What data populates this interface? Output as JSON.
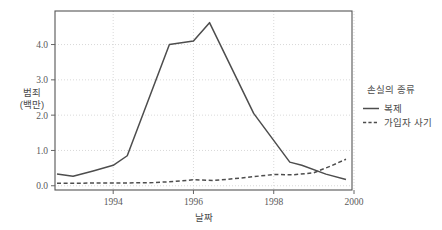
{
  "chart_data": {
    "type": "line",
    "title": "",
    "xlabel": "날짜",
    "ylabel": "범죄\n(백만)",
    "ylabel_line1": "범죄",
    "ylabel_line2": "(백만)",
    "xlim": [
      1992.55,
      1999.95
    ],
    "ylim": [
      -0.12,
      4.95
    ],
    "xticks": [
      1994,
      1996,
      1998,
      2000
    ],
    "xtick_labels": [
      "1994",
      "1996",
      "1998",
      "2000"
    ],
    "yticks": [
      0.0,
      1.0,
      2.0,
      3.0,
      4.0
    ],
    "ytick_labels": [
      "0.0",
      "1.0",
      "2.0",
      "3.0",
      "4.0"
    ],
    "grid": true,
    "grid_style": "dotted",
    "legend_position": "right",
    "legend_title": "손실의 종류",
    "series": [
      {
        "name": "복제",
        "style": "solid",
        "color": "#4d4d4d",
        "x": [
          1992.6,
          1993.0,
          1993.5,
          1994.0,
          1994.35,
          1995.4,
          1996.0,
          1996.4,
          1997.5,
          1998.4,
          1998.7,
          1999.3,
          1999.8
        ],
        "y": [
          0.33,
          0.27,
          0.42,
          0.58,
          0.85,
          4.0,
          4.1,
          4.62,
          2.05,
          0.67,
          0.58,
          0.33,
          0.18
        ]
      },
      {
        "name": "가입자 사기",
        "style": "dashed",
        "color": "#4d4d4d",
        "x": [
          1992.6,
          1993.0,
          1993.6,
          1994.3,
          1995.0,
          1995.5,
          1996.0,
          1996.5,
          1997.2,
          1998.0,
          1998.5,
          1999.0,
          1999.4,
          1999.8
        ],
        "y": [
          0.07,
          0.07,
          0.08,
          0.08,
          0.09,
          0.12,
          0.17,
          0.15,
          0.22,
          0.32,
          0.31,
          0.37,
          0.55,
          0.75
        ]
      }
    ]
  },
  "legend": {
    "title": "손실의 종류",
    "items": [
      {
        "label": "복제",
        "style": "solid"
      },
      {
        "label": "가입자 사기",
        "style": "dashed"
      }
    ]
  },
  "axes": {
    "x_title": "날짜",
    "y_title_line1": "범죄",
    "y_title_line2": "(백만)"
  }
}
